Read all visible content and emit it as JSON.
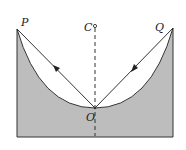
{
  "diagram": {
    "type": "physics-bowl-trajectory",
    "labels": {
      "P": "P",
      "C": "C",
      "Q": "Q",
      "O": "O"
    },
    "colors": {
      "fill": "#bdbdbd",
      "stroke": "#333333",
      "background": "#ffffff"
    },
    "points": {
      "P": [
        17,
        29
      ],
      "Q": [
        173,
        28
      ],
      "C": [
        95,
        26
      ],
      "O": [
        95,
        108
      ]
    },
    "segments": [
      {
        "from": "O",
        "to": "P",
        "arrow_direction": "toward-P"
      },
      {
        "from": "Q",
        "to": "O",
        "arrow_direction": "toward-O"
      }
    ],
    "axis": {
      "from": "C",
      "style": "dashed"
    }
  }
}
